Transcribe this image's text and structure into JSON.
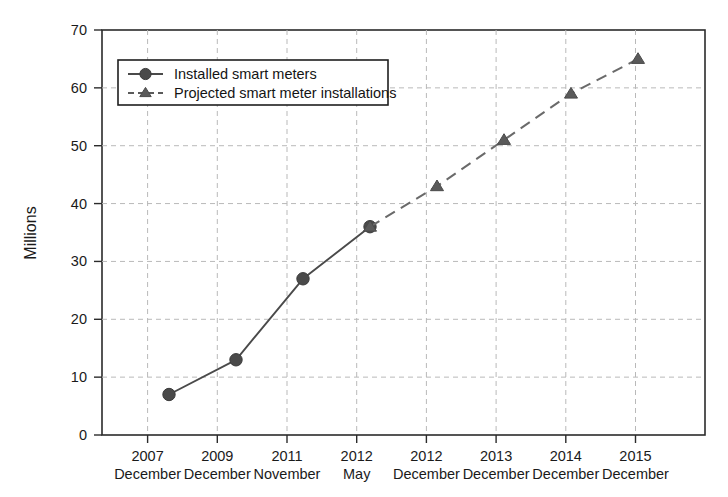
{
  "chart_data": {
    "type": "line",
    "title": "",
    "subtitle": "",
    "xlabel": "",
    "ylabel": "Millions",
    "ylim": [
      0,
      70
    ],
    "ytick_step": 10,
    "yticks": [
      "0",
      "10",
      "20",
      "30",
      "40",
      "50",
      "60",
      "70"
    ],
    "grid": true,
    "grid_axis": "both",
    "legend_position": "upper-left-inside",
    "categories": [
      "2007 December",
      "2009 December",
      "2011 November",
      "2012 May",
      "2012 December",
      "2013 December",
      "2014 December",
      "2015 December"
    ],
    "category_lines": [
      {
        "year": "2007",
        "month": "December"
      },
      {
        "year": "2009",
        "month": "December"
      },
      {
        "year": "2011",
        "month": "November"
      },
      {
        "year": "2012",
        "month": "May"
      },
      {
        "year": "2012",
        "month": "December"
      },
      {
        "year": "2013",
        "month": "December"
      },
      {
        "year": "2014",
        "month": "December"
      },
      {
        "year": "2015",
        "month": "December"
      }
    ],
    "series": [
      {
        "name": "Installed smart meters",
        "marker": "circle",
        "linestyle": "solid",
        "color": "#4a4a4a",
        "x": [
          "2007 December",
          "2009 December",
          "2011 November",
          "2012 May"
        ],
        "values": [
          7,
          13,
          27,
          36
        ]
      },
      {
        "name": "Projected smart meter installations",
        "marker": "triangle",
        "linestyle": "dashed",
        "color": "#5a5a5a",
        "x": [
          "2012 May",
          "2012 December",
          "2013 December",
          "2014 December",
          "2015 December"
        ],
        "values": [
          36,
          43,
          51,
          59,
          65
        ]
      }
    ]
  },
  "legend": {
    "entries": [
      {
        "label": "Installed smart meters",
        "marker": "circle-marker-icon"
      },
      {
        "label": "Projected smart meter installations",
        "marker": "triangle-marker-icon"
      }
    ]
  },
  "colors": {
    "installed": "#4a4a4a",
    "projected": "#5a5a5a",
    "grid": "#b9b9b9",
    "axis": "#2b2b2b",
    "background": "#ffffff"
  }
}
